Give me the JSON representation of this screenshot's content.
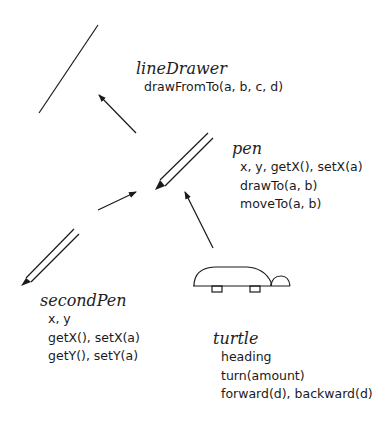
{
  "diagram": {
    "objects": [
      {
        "id": "lineDrawer",
        "name": "lineDrawer",
        "members": [
          "drawFromTo(a, b, c, d)"
        ]
      },
      {
        "id": "pen",
        "name": "pen",
        "members": [
          "x, y, getX(), setX(a)",
          "drawTo(a, b)",
          "moveTo(a, b)"
        ]
      },
      {
        "id": "secondPen",
        "name": "secondPen",
        "members": [
          "x, y",
          "getX(), setX(a)",
          "getY(), setY(a)"
        ]
      },
      {
        "id": "turtle",
        "name": "turtle",
        "members": [
          "heading",
          "turn(amount)",
          "forward(d), backward(d)"
        ]
      }
    ],
    "connections": [
      {
        "from": "pen",
        "to": "lineDrawer"
      },
      {
        "from": "secondPen",
        "to": "pen"
      },
      {
        "from": "turtle",
        "to": "pen"
      }
    ],
    "icons": [
      "drawn-line-icon",
      "pen-icon",
      "second-pen-icon",
      "turtle-icon"
    ],
    "colors": {
      "stroke": "#1a1a1a",
      "background": "#ffffff"
    }
  }
}
